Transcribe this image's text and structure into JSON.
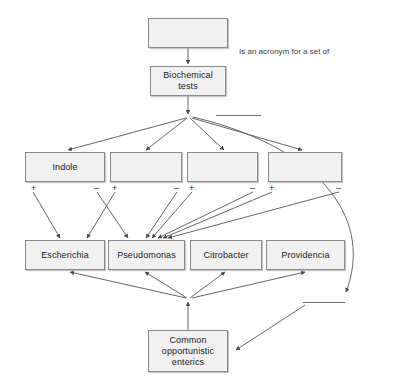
{
  "diagram": {
    "nodes": {
      "top_blank": {
        "label": ""
      },
      "biochemical_tests": {
        "label": "Biochemical\ntests"
      },
      "test1": {
        "label": "Indole"
      },
      "test2": {
        "label": ""
      },
      "test3": {
        "label": ""
      },
      "test4": {
        "label": ""
      },
      "genus1": {
        "label": "Escherichia"
      },
      "genus2": {
        "label": "Pseudomonas"
      },
      "genus3": {
        "label": "Citrobacter"
      },
      "genus4": {
        "label": "Providencia"
      },
      "common": {
        "label": "Common\nopportunistic\nenterics"
      }
    },
    "signs": {
      "t1_plus": "+",
      "t1_minus": "–",
      "t2_plus": "+",
      "t2_minus": "–",
      "t3_plus": "+",
      "t3_minus": "–",
      "t4_plus": "+",
      "t4_minus": "–"
    },
    "annotations": {
      "acronym_text": "Is an acronym for a set of",
      "blank_label_upper": "",
      "blank_label_lower": ""
    },
    "colors": {
      "node_fill": "#f1f1f1",
      "node_border": "#8a8a8a",
      "edge": "#555555",
      "text": "#1a1a1a",
      "background": "#ffffff"
    }
  }
}
